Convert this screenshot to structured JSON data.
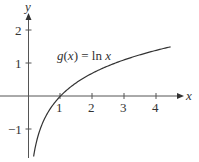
{
  "chart_data": {
    "type": "line",
    "title": "",
    "function_label": "g(x) = ln x",
    "xlabel": "x",
    "ylabel": "y",
    "xlim": [
      0,
      4.8
    ],
    "ylim": [
      -1.8,
      2.5
    ],
    "x_ticks": [
      1,
      2,
      3,
      4
    ],
    "y_ticks": [
      -1,
      1,
      2
    ],
    "grid": false,
    "series": [
      {
        "name": "g(x) = ln x",
        "x": [
          0.16,
          0.25,
          0.37,
          0.5,
          0.75,
          1,
          1.5,
          2,
          2.5,
          3,
          3.5,
          4,
          4.44
        ],
        "y": [
          -1.83,
          -1.39,
          -0.99,
          -0.69,
          -0.29,
          0,
          0.41,
          0.69,
          0.92,
          1.1,
          1.25,
          1.39,
          1.49
        ]
      }
    ]
  },
  "labels": {
    "x_axis": "x",
    "y_axis": "y",
    "tick_x1": "1",
    "tick_x2": "2",
    "tick_x3": "3",
    "tick_x4": "4",
    "tick_y2": "2",
    "tick_y1": "1",
    "tick_yneg1": "−1",
    "func_name": "g",
    "func_open": "(",
    "func_var": "x",
    "func_close": ") = ln ",
    "func_var2": "x"
  },
  "colors": {
    "axis": "#555555",
    "curve": "#333333",
    "text": "#333333"
  }
}
